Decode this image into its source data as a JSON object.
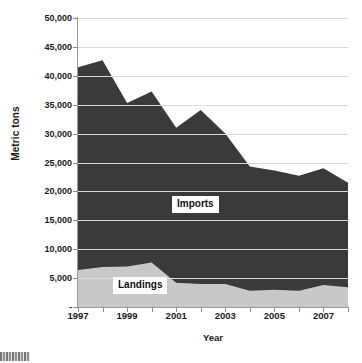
{
  "chart_data": {
    "type": "area",
    "stacked": true,
    "title": "",
    "xlabel": "Year",
    "ylabel": "Metric tons",
    "x": [
      1997,
      1998,
      1999,
      2000,
      2001,
      2002,
      2003,
      2004,
      2005,
      2006,
      2007,
      2008
    ],
    "categories": [
      "1997",
      "1998",
      "1999",
      "2000",
      "2001",
      "2002",
      "2003",
      "2004",
      "2005",
      "2006",
      "2007",
      "2008"
    ],
    "series": [
      {
        "name": "Landings",
        "color": "#c8c8c8",
        "values": [
          6400,
          6900,
          7000,
          7700,
          4200,
          4000,
          4000,
          2800,
          3000,
          2800,
          3800,
          3400
        ]
      },
      {
        "name": "Imports",
        "color": "#3a3a3a",
        "values": [
          35100,
          35800,
          28300,
          29600,
          26800,
          30100,
          26000,
          21500,
          20600,
          19900,
          20200,
          18100
        ]
      }
    ],
    "totals": [
      41500,
      42700,
      35300,
      37300,
      31000,
      34100,
      30000,
      24300,
      23600,
      22700,
      24000,
      21500
    ],
    "ylim": [
      0,
      50000
    ],
    "ytick_values": [
      0,
      5000,
      10000,
      15000,
      20000,
      25000,
      30000,
      35000,
      40000,
      45000,
      50000
    ],
    "ytick_labels": [
      "-",
      "5,000",
      "10,000",
      "15,000",
      "20,000",
      "25,000",
      "30,000",
      "35,000",
      "40,000",
      "45,000",
      "50,000"
    ],
    "xtick_values": [
      1997,
      1999,
      2001,
      2003,
      2005,
      2007
    ],
    "xtick_labels": [
      "1997",
      "1999",
      "2001",
      "2003",
      "2005",
      "2007"
    ],
    "xlim": [
      1997,
      2008
    ],
    "grid": "horizontal",
    "legend": "inline-annotations",
    "annotations": [
      {
        "name": "Imports",
        "text": "Imports"
      },
      {
        "name": "Landings",
        "text": "Landings"
      }
    ]
  },
  "axes": {
    "y_title": "Metric tons",
    "x_title": "Year"
  },
  "colors": {
    "imports_fill": "#3a3a3a",
    "landings_fill": "#c8c8c8",
    "gridline": "#d9d9d9",
    "axis": "#9a9a9a",
    "plot_background": "#ffffff"
  }
}
